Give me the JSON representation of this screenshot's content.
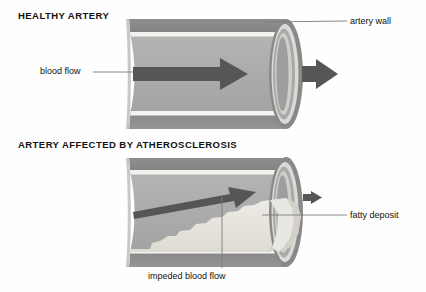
{
  "figure": {
    "kind": "medical-illustration",
    "background_color": "#fefefe"
  },
  "sections": {
    "healthy": {
      "title": "HEALTHY ARTERY"
    },
    "diseased": {
      "title": "ARTERY AFFECTED BY ATHEROSCLEROSIS"
    }
  },
  "labels": {
    "artery_wall": "artery wall",
    "blood_flow": "blood flow",
    "fatty_deposit": "fatty deposit",
    "impeded_blood_flow": "impeded blood flow"
  },
  "colors": {
    "wall_dark": "#8c8c8c",
    "wall_highlight": "#f2f1ee",
    "lumen": "#ababab",
    "lumen_light": "#b6b6b6",
    "endcap_ring_outer": "#8c8c8c",
    "endcap_ring_mid": "#d8d7d2",
    "endcap_inner": "#9d9d9d",
    "arrow_dark": "#555555",
    "plaque": "#e9e7e1",
    "plaque_shade": "#d6d4cd",
    "leader_line": "#7a7a7a",
    "text": "#111111"
  },
  "icons": {
    "flow_arrow": "arrow-right",
    "exit_arrow": "arrow-right-small"
  }
}
